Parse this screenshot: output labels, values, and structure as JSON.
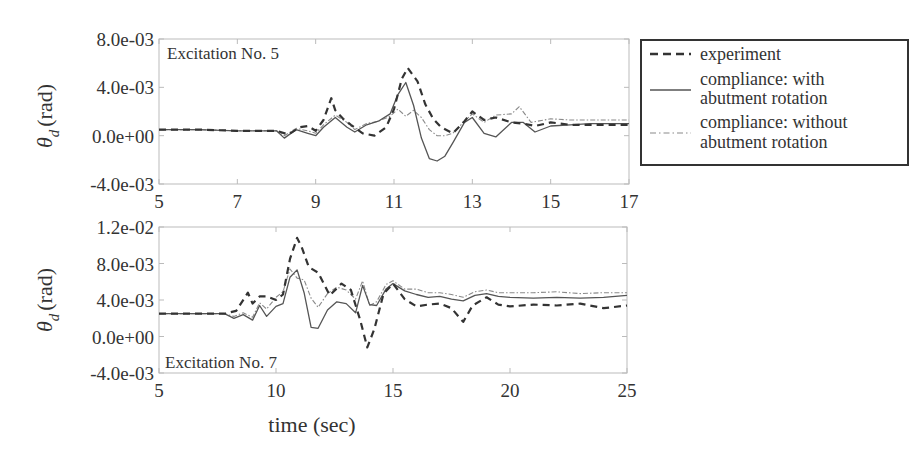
{
  "chart_data": [
    {
      "type": "line",
      "panel": "top",
      "annotation": "Excitation No. 5",
      "xlabel": "",
      "ylabel": "θ_d (rad)",
      "xlim": [
        5,
        17
      ],
      "ylim": [
        -0.004,
        0.008
      ],
      "xticks": [
        5,
        7,
        9,
        11,
        13,
        15,
        17
      ],
      "yticks": [
        -0.004,
        0.0,
        0.004,
        0.008
      ],
      "ytick_labels": [
        "-4.0e-03",
        "0.0e+00",
        "4.0e-03",
        "8.0e-03"
      ],
      "grid": false,
      "series": [
        {
          "name": "experiment",
          "style": "dashed",
          "x": [
            5.0,
            6.0,
            7.0,
            8.0,
            8.3,
            8.6,
            8.8,
            9.0,
            9.2,
            9.4,
            9.5,
            9.7,
            9.9,
            10.2,
            10.5,
            10.8,
            11.0,
            11.2,
            11.35,
            11.6,
            11.8,
            12.0,
            12.2,
            12.5,
            12.8,
            13.0,
            13.3,
            13.6,
            14.0,
            14.3,
            14.6,
            15.0,
            15.5,
            16.0,
            16.5,
            17.0
          ],
          "y": [
            0.0005,
            0.0005,
            0.0004,
            0.0004,
            0.0001,
            0.0007,
            0.0008,
            0.0004,
            0.0013,
            0.0031,
            0.0021,
            0.0014,
            0.0009,
            0.0002,
            0.0,
            0.0007,
            0.0022,
            0.0047,
            0.0056,
            0.0045,
            0.0026,
            0.0014,
            0.0007,
            0.0002,
            0.0012,
            0.002,
            0.0013,
            0.0015,
            0.0011,
            0.001,
            0.0008,
            0.0011,
            0.0009,
            0.0009,
            0.0009,
            0.0009
          ]
        },
        {
          "name": "compliance: with abutment rotation",
          "style": "solid",
          "x": [
            5.0,
            6.0,
            7.0,
            8.0,
            8.2,
            8.5,
            8.8,
            9.0,
            9.2,
            9.5,
            9.8,
            10.0,
            10.3,
            10.6,
            10.9,
            11.1,
            11.3,
            11.5,
            11.7,
            11.9,
            12.1,
            12.3,
            12.5,
            12.8,
            13.0,
            13.3,
            13.6,
            14.0,
            14.3,
            14.6,
            15.0,
            15.5,
            16.0,
            16.5,
            17.0
          ],
          "y": [
            0.0005,
            0.0005,
            0.0004,
            0.0004,
            -0.0002,
            0.0005,
            0.0002,
            0.0,
            0.0007,
            0.0015,
            0.0007,
            0.0003,
            0.0009,
            0.0012,
            0.0018,
            0.0034,
            0.0044,
            0.0025,
            -0.0002,
            -0.0019,
            -0.0021,
            -0.0017,
            -0.0006,
            0.0011,
            0.0015,
            0.0002,
            -0.0001,
            0.0011,
            0.0011,
            0.0003,
            0.0008,
            0.0009,
            0.001,
            0.001,
            0.001
          ]
        },
        {
          "name": "compliance: without abutment rotation",
          "style": "dashdot",
          "x": [
            5.0,
            6.0,
            7.0,
            8.0,
            8.2,
            8.5,
            8.8,
            9.0,
            9.2,
            9.5,
            9.8,
            10.0,
            10.3,
            10.6,
            10.9,
            11.1,
            11.3,
            11.5,
            11.7,
            11.9,
            12.1,
            12.3,
            12.5,
            12.8,
            13.0,
            13.3,
            13.6,
            14.0,
            14.2,
            14.5,
            15.0,
            15.5,
            16.0,
            16.5,
            17.0
          ],
          "y": [
            0.0005,
            0.0005,
            0.0004,
            0.0004,
            0.0,
            0.0006,
            0.0004,
            0.0002,
            0.0009,
            0.0017,
            0.0011,
            0.0005,
            0.001,
            0.0012,
            0.0016,
            0.0022,
            0.0016,
            0.0021,
            0.0015,
            0.0005,
            0.0,
            0.0,
            0.0002,
            0.0012,
            0.0018,
            0.0011,
            0.0017,
            0.0018,
            0.0024,
            0.0011,
            0.0014,
            0.0013,
            0.0013,
            0.0013,
            0.0013
          ]
        }
      ]
    },
    {
      "type": "line",
      "panel": "bottom",
      "annotation": "Excitation No. 7",
      "xlabel": "time (sec)",
      "ylabel": "θ_d (rad)",
      "xlim": [
        5,
        25
      ],
      "ylim": [
        -0.004,
        0.012
      ],
      "xticks": [
        5,
        10,
        15,
        20,
        25
      ],
      "yticks": [
        -0.004,
        0.0,
        0.004,
        0.008,
        0.012
      ],
      "ytick_labels": [
        "-4.0e-03",
        "0.0e+00",
        "4.0e-03",
        "8.0e-03",
        "1.2e-02"
      ],
      "grid": false,
      "series": [
        {
          "name": "experiment",
          "style": "dashed",
          "x": [
            5.0,
            6.0,
            7.0,
            7.8,
            8.3,
            8.8,
            9.0,
            9.3,
            9.6,
            10.0,
            10.3,
            10.6,
            10.9,
            11.1,
            11.4,
            11.8,
            12.3,
            12.8,
            13.2,
            13.6,
            13.9,
            14.2,
            14.6,
            15.0,
            15.5,
            16.0,
            16.5,
            17.0,
            17.5,
            18.0,
            18.4,
            19.0,
            19.5,
            20.0,
            21.0,
            22.0,
            23.0,
            24.0,
            25.0
          ],
          "y": [
            0.0025,
            0.0025,
            0.0025,
            0.0025,
            0.0028,
            0.0048,
            0.0036,
            0.0044,
            0.0044,
            0.004,
            0.0046,
            0.0085,
            0.0108,
            0.0098,
            0.0076,
            0.007,
            0.0045,
            0.0058,
            0.0051,
            0.0018,
            -0.0012,
            0.0008,
            0.0047,
            0.0058,
            0.0041,
            0.0033,
            0.0035,
            0.0036,
            0.0031,
            0.0016,
            0.0034,
            0.0043,
            0.0035,
            0.0033,
            0.0035,
            0.0034,
            0.0036,
            0.0031,
            0.0034
          ]
        },
        {
          "name": "compliance: with abutment rotation",
          "style": "solid",
          "x": [
            5.0,
            6.0,
            7.0,
            7.8,
            8.2,
            8.6,
            9.0,
            9.3,
            9.6,
            10.0,
            10.3,
            10.6,
            10.9,
            11.2,
            11.5,
            11.8,
            12.2,
            12.6,
            13.0,
            13.4,
            13.7,
            14.0,
            14.3,
            14.7,
            15.0,
            15.5,
            16.0,
            16.5,
            17.0,
            17.5,
            18.0,
            18.5,
            19.0,
            19.5,
            20.0,
            21.0,
            22.0,
            23.0,
            24.0,
            25.0
          ],
          "y": [
            0.0025,
            0.0025,
            0.0025,
            0.0025,
            0.002,
            0.0024,
            0.0018,
            0.0034,
            0.0022,
            0.0033,
            0.0036,
            0.0065,
            0.0073,
            0.0048,
            0.001,
            0.0009,
            0.0029,
            0.0038,
            0.0036,
            0.0026,
            0.0056,
            0.0035,
            0.0034,
            0.0052,
            0.0058,
            0.005,
            0.0046,
            0.0043,
            0.0044,
            0.0041,
            0.0039,
            0.0045,
            0.0047,
            0.0044,
            0.0043,
            0.0042,
            0.0043,
            0.0042,
            0.0043,
            0.0045
          ]
        },
        {
          "name": "compliance: without abutment rotation",
          "style": "dashdot",
          "x": [
            5.0,
            6.0,
            7.0,
            7.8,
            8.2,
            8.6,
            9.0,
            9.3,
            9.6,
            10.0,
            10.3,
            10.6,
            10.9,
            11.2,
            11.5,
            11.8,
            12.2,
            12.6,
            13.0,
            13.4,
            13.7,
            14.0,
            14.3,
            14.7,
            15.0,
            15.5,
            16.0,
            16.5,
            17.0,
            17.5,
            18.0,
            18.5,
            19.0,
            19.5,
            20.0,
            21.0,
            22.0,
            23.0,
            24.0,
            25.0
          ],
          "y": [
            0.0025,
            0.0025,
            0.0025,
            0.0025,
            0.0022,
            0.0026,
            0.0021,
            0.0037,
            0.003,
            0.0043,
            0.0049,
            0.0074,
            0.0064,
            0.0062,
            0.0042,
            0.0032,
            0.0047,
            0.0054,
            0.0051,
            0.0041,
            0.0061,
            0.0034,
            0.0038,
            0.0057,
            0.0061,
            0.0052,
            0.0052,
            0.0048,
            0.0048,
            0.0046,
            0.0043,
            0.0049,
            0.0051,
            0.0048,
            0.0048,
            0.0048,
            0.0049,
            0.0047,
            0.0048,
            0.0048
          ]
        }
      ]
    }
  ],
  "ylabel_symbol": "θ",
  "ylabel_subscript": "d",
  "ylabel_unit": "(rad)",
  "top_panel": {
    "annotation": "Excitation No. 5",
    "xtick_labels": [
      "5",
      "7",
      "9",
      "11",
      "13",
      "15",
      "17"
    ],
    "ytick_labels": [
      "8.0e-03",
      "4.0e-03",
      "0.0e+00",
      "-4.0e-03"
    ]
  },
  "bottom_panel": {
    "annotation": "Excitation No. 7",
    "xtick_labels": [
      "5",
      "10",
      "15",
      "20",
      "25"
    ],
    "ytick_labels": [
      "1.2e-02",
      "8.0e-03",
      "4.0e-03",
      "0.0e+00",
      "-4.0e-03"
    ],
    "xlabel": "time (sec)"
  },
  "legend": {
    "items": [
      {
        "line1": "experiment",
        "line2": "",
        "style": "dashed"
      },
      {
        "line1": "compliance: with",
        "line2": "abutment rotation",
        "style": "solid"
      },
      {
        "line1": "compliance: without",
        "line2": "abutment rotation",
        "style": "dashdot"
      }
    ]
  },
  "colors": {
    "experiment": "#333333",
    "with_rotation": "#555555",
    "without_rotation": "#8a8a8a",
    "frame": "#bbbbbb",
    "text": "#333333"
  }
}
